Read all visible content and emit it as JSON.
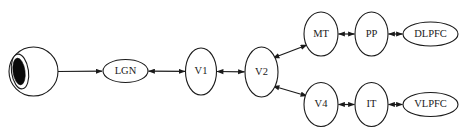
{
  "figure": {
    "background_color": "#ffffff",
    "stroke_color": "#1a1a1a",
    "width": 464,
    "height": 133
  },
  "nodes": [
    {
      "id": "eye",
      "label": "",
      "shape": "eye",
      "cx": 33.5,
      "cy": 71.5,
      "rx": 22.5,
      "ry": 24.5,
      "font_size": 0
    },
    {
      "id": "lgn",
      "label": "LGN",
      "shape": "ellipse",
      "cx": 125.5,
      "cy": 71.0,
      "rx": 22.5,
      "ry": 11.5,
      "font_size": 10.5
    },
    {
      "id": "v1",
      "label": "V1",
      "shape": "ellipse",
      "cx": 201.0,
      "cy": 71.5,
      "rx": 15.5,
      "ry": 23.5,
      "font_size": 10.5
    },
    {
      "id": "v2",
      "label": "V2",
      "shape": "ellipse",
      "cx": 261.5,
      "cy": 72.0,
      "rx": 16.5,
      "ry": 25.0,
      "font_size": 10.5
    },
    {
      "id": "mt",
      "label": "MT",
      "shape": "ellipse",
      "cx": 321.0,
      "cy": 34.0,
      "rx": 17.0,
      "ry": 22.0,
      "font_size": 10.5
    },
    {
      "id": "pp",
      "label": "PP",
      "shape": "ellipse",
      "cx": 371.5,
      "cy": 34.0,
      "rx": 16.5,
      "ry": 22.0,
      "font_size": 10.5
    },
    {
      "id": "dlpfc",
      "label": "DLPFC",
      "shape": "ellipse",
      "cx": 430.5,
      "cy": 34.0,
      "rx": 27.5,
      "ry": 12.0,
      "font_size": 10.5
    },
    {
      "id": "v4",
      "label": "V4",
      "shape": "ellipse",
      "cx": 321.0,
      "cy": 104.5,
      "rx": 17.0,
      "ry": 22.0,
      "font_size": 10.5
    },
    {
      "id": "it",
      "label": "IT",
      "shape": "ellipse",
      "cx": 371.5,
      "cy": 104.5,
      "rx": 16.5,
      "ry": 22.0,
      "font_size": 10.5
    },
    {
      "id": "vlpfc",
      "label": "VLPFC",
      "shape": "ellipse",
      "cx": 430.5,
      "cy": 104.5,
      "rx": 27.5,
      "ry": 12.0,
      "font_size": 10.5
    }
  ],
  "edges": [
    {
      "id": "eye-lgn",
      "from": "eye",
      "to": "lgn",
      "direction": "forward",
      "x1": 57,
      "y1": 71.5,
      "x2": 102,
      "y2": 71.2
    },
    {
      "id": "lgn-v1",
      "from": "lgn",
      "to": "v1",
      "direction": "bidirectional",
      "x1": 148.5,
      "y1": 71.2,
      "x2": 185,
      "y2": 71.4
    },
    {
      "id": "v1-v2",
      "from": "v1",
      "to": "v2",
      "direction": "bidirectional",
      "x1": 217,
      "y1": 71.5,
      "x2": 244.5,
      "y2": 71.8
    },
    {
      "id": "v2-mt",
      "from": "v2",
      "to": "mt",
      "direction": "bidirectional",
      "x1": 273,
      "y1": 58,
      "x2": 307,
      "y2": 45
    },
    {
      "id": "v2-v4",
      "from": "v2",
      "to": "v4",
      "direction": "bidirectional",
      "x1": 273,
      "y1": 86,
      "x2": 307,
      "y2": 96
    },
    {
      "id": "mt-pp",
      "from": "mt",
      "to": "pp",
      "direction": "bidirectional",
      "x1": 338.5,
      "y1": 34,
      "x2": 354.5,
      "y2": 34
    },
    {
      "id": "pp-dlpfc",
      "from": "pp",
      "to": "dlpfc",
      "direction": "bidirectional",
      "x1": 388.5,
      "y1": 34,
      "x2": 402.5,
      "y2": 34
    },
    {
      "id": "v4-it",
      "from": "v4",
      "to": "it",
      "direction": "bidirectional",
      "x1": 338.5,
      "y1": 104.5,
      "x2": 354.5,
      "y2": 104.5
    },
    {
      "id": "it-vlpfc",
      "from": "it",
      "to": "vlpfc",
      "direction": "bidirectional",
      "x1": 388.5,
      "y1": 104.5,
      "x2": 402.5,
      "y2": 104.5
    }
  ]
}
